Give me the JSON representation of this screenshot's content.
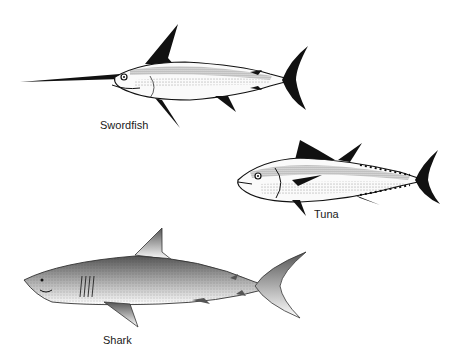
{
  "figure": {
    "background": "#ffffff",
    "ink": "#1a1a1a",
    "fish": [
      {
        "name": "swordfish",
        "label": "Swordfish"
      },
      {
        "name": "tuna",
        "label": "Tuna"
      },
      {
        "name": "shark",
        "label": "Shark"
      }
    ]
  }
}
